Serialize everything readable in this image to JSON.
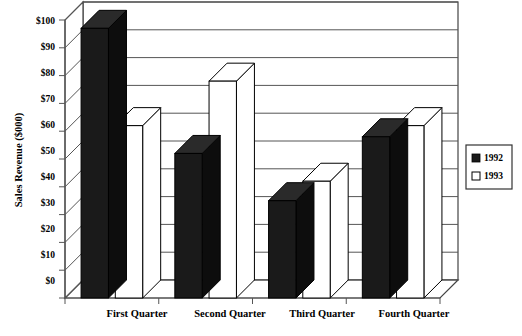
{
  "chart_data": {
    "type": "bar",
    "title": "",
    "subtitle": "",
    "xlabel": "",
    "ylabel": "Sales Revenue ($000)",
    "categories": [
      "First Quarter",
      "Second Quarter",
      "Third Quarter",
      "Fourth Quarter"
    ],
    "series": [
      {
        "name": "1992",
        "color": "#1a1a1a",
        "values": [
          97,
          52,
          35,
          58
        ]
      },
      {
        "name": "1993",
        "color": "#ffffff",
        "values": [
          62,
          78,
          42,
          62
        ]
      }
    ],
    "ylim": [
      0,
      100
    ],
    "ytick_values": [
      0,
      10,
      20,
      30,
      40,
      50,
      60,
      70,
      80,
      90,
      100
    ],
    "ytick_labels": [
      "$0",
      "$10",
      "$20",
      "$30",
      "$40",
      "$50",
      "$60",
      "$70",
      "$80",
      "$90",
      "$100"
    ],
    "grid": true,
    "grid_axis": "y",
    "legend_position": "right",
    "legend_entries": [
      {
        "label": "1992",
        "swatch": "filled-black"
      },
      {
        "label": "1993",
        "swatch": "empty-white"
      }
    ],
    "projection": "3d-isometric",
    "depth_px": 18
  },
  "legend": {
    "items": [
      {
        "label": "1992",
        "swatch_name": "legend-swatch-1992"
      },
      {
        "label": "1993",
        "swatch_name": "legend-swatch-1993"
      }
    ]
  },
  "axes": {
    "y_title": "Sales Revenue ($000)",
    "y_ticks": [
      "$100",
      "$90",
      "$80",
      "$70",
      "$60",
      "$50",
      "$40",
      "$30",
      "$20",
      "$10",
      "$0"
    ],
    "x_ticks": [
      "First Quarter",
      "Second Quarter",
      "Third Quarter",
      "Fourth Quarter"
    ]
  }
}
